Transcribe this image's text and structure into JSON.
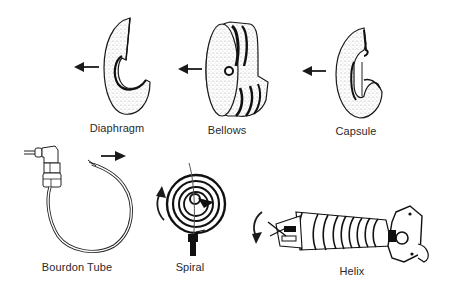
{
  "diagram": {
    "colors": {
      "ink": "#1a1a1a",
      "stipple": "#6a6a6a",
      "paper": "#ffffff",
      "label": "#2a2a2a"
    },
    "elements": [
      {
        "id": "diaphragm",
        "label": "Diaphragm",
        "motion": "arrow-left",
        "label_pos": [
          117,
          122
        ]
      },
      {
        "id": "bellows",
        "label": "Bellows",
        "motion": "arrow-left",
        "label_pos": [
          227,
          124
        ]
      },
      {
        "id": "capsule",
        "label": "Capsule",
        "motion": "arrow-left",
        "label_pos": [
          356,
          125
        ]
      },
      {
        "id": "bourdon-tube",
        "label": "Bourdon Tube",
        "motion": "arrow-right",
        "label_pos": [
          77,
          261
        ]
      },
      {
        "id": "spiral",
        "label": "Spiral",
        "motion": "rotate-counterclockwise",
        "label_pos": [
          190,
          261
        ]
      },
      {
        "id": "helix",
        "label": "Helix",
        "motion": "rotate-counterclockwise",
        "label_pos": [
          352,
          265
        ]
      }
    ]
  }
}
